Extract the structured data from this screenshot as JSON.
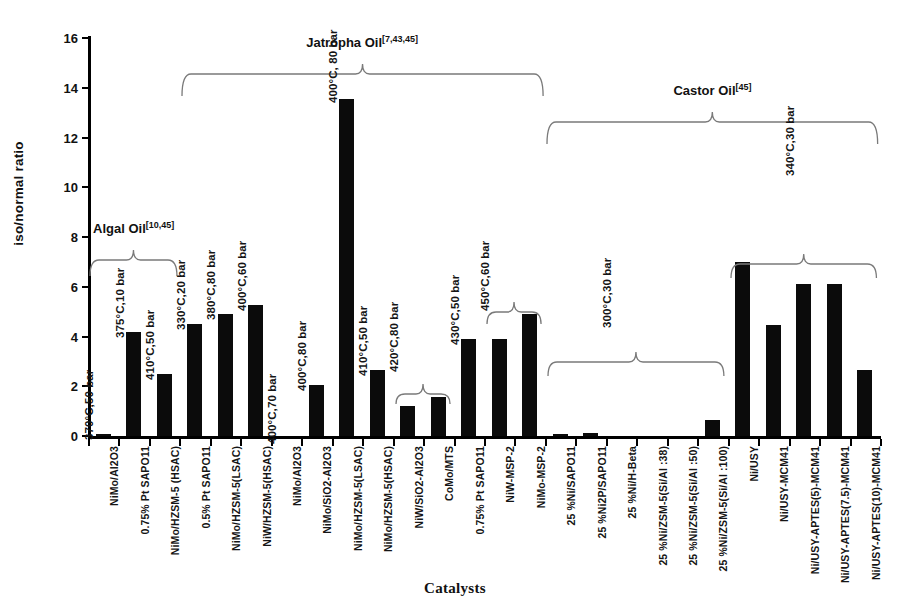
{
  "chart_data": {
    "type": "bar",
    "title": "",
    "xlabel": "Catalysts",
    "ylabel": "iso/normal  ratio",
    "ylim": [
      0,
      16
    ],
    "yticks": [
      0,
      2,
      4,
      6,
      8,
      10,
      12,
      14,
      16
    ],
    "grid": false,
    "legend": "none",
    "categories": [
      "NiMo/Al2O3",
      "0.75% Pt SAPO11",
      "NiMo/HZSM-5 (HSAC)",
      "0.5% Pt SAPO11",
      "NiMo/HZSM-5(LSAC)",
      "NiW/HZSM-5(HSAC)",
      "NiMo/Al2O3",
      "NiMo/SiO2-Al2O3",
      "NiMo/HZSM-5(LSAC)",
      "NiMo/HZSM-5(HSAC)",
      "NiW/SiO2-Al2O3",
      "CoMo/MTS",
      "0.75% Pt SAPO11",
      "NiW-MSP-2",
      "NiMo-MSP-2",
      "25 %Ni/SAPO11",
      "25 %Ni2P/SAPO11",
      "25 %Ni/H-Beta",
      "25 %Ni/ZSM-5(Si/Al :38)",
      "25 %Ni/ZSM-5(Si/Al :50)",
      "25 %Ni/ZSM-5(Si/Al :100)",
      "Ni/USY",
      "Ni/USY-MCM41",
      "Ni/USY-APTES(5)-MCM41",
      "Ni/USY-APTES(7.5)-MCM41",
      "Ni/USY-APTES(10)-MCM41"
    ],
    "values": [
      0.08,
      4.2,
      2.5,
      4.5,
      4.9,
      5.25,
      0.0,
      2.05,
      13.55,
      2.65,
      1.2,
      1.55,
      3.9,
      3.9,
      4.9,
      0.1,
      0.12,
      0.0,
      0.0,
      0.0,
      0.65,
      7.0,
      4.45,
      6.1,
      6.1,
      2.65
    ],
    "condition_labels": [
      {
        "index": 0,
        "text": "370°C,50 bar"
      },
      {
        "index": 1,
        "text": "375°C,10 bar"
      },
      {
        "index": 2,
        "text": "410°C,50 bar"
      },
      {
        "index": 3,
        "text": "330°C,20 bar"
      },
      {
        "index": 4,
        "text": "380°C,80 bar"
      },
      {
        "index": 5,
        "text": "400°C,60 bar"
      },
      {
        "index": 6,
        "text": "400°C,70 bar"
      },
      {
        "index": 7,
        "text": "400°C,80 bar"
      },
      {
        "index": 8,
        "text": "400°C, 80 bar"
      },
      {
        "index": 9,
        "text": "410°C,50 bar"
      },
      {
        "index": 10,
        "text": "420°C,80 bar"
      },
      {
        "index": 12,
        "text": "430°C,50 bar"
      },
      {
        "index": 13,
        "text": "450°C,60 bar"
      },
      {
        "index": 17,
        "text": "300°C,30 bar"
      },
      {
        "index": 23,
        "text": "340°C,30 bar"
      }
    ],
    "groups": [
      {
        "name": "Algal Oil",
        "refs": "[10,45]",
        "from": 0,
        "to": 2
      },
      {
        "name": "Jatropha Oil",
        "refs": "[7,43,45]",
        "from": 3,
        "to": 14
      },
      {
        "name": "Castor Oil",
        "refs": "[45]",
        "from": 15,
        "to": 25
      }
    ],
    "subbrackets": [
      {
        "from": 10,
        "to": 11
      },
      {
        "from": 13,
        "to": 14
      },
      {
        "from": 15,
        "to": 20
      },
      {
        "from": 21,
        "to": 25
      }
    ]
  }
}
